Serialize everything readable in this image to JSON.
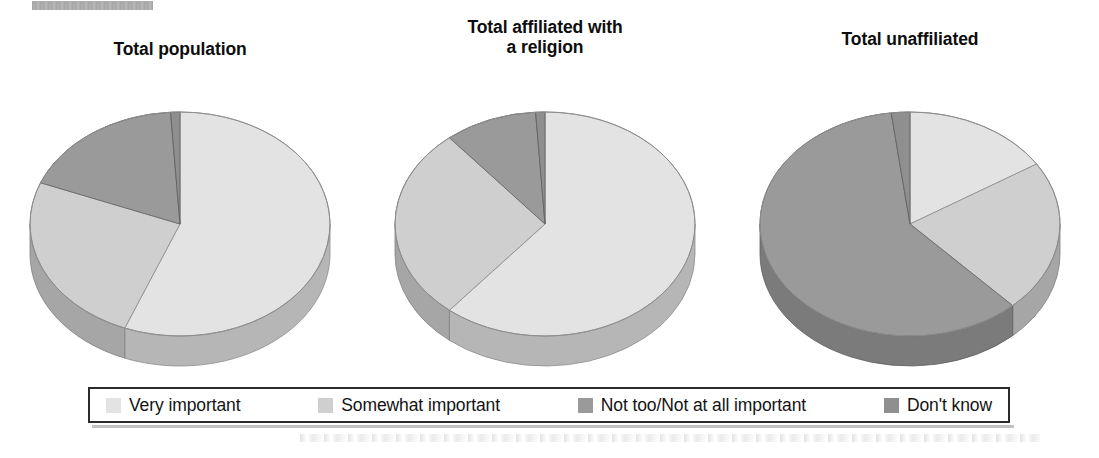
{
  "page": {
    "redacted_bar": "redacted-source-label",
    "background_color": "#ffffff"
  },
  "legend": {
    "items": [
      {
        "label": "Very important",
        "color": "#e3e3e3",
        "key": "very_important"
      },
      {
        "label": "Somewhat important",
        "color": "#cfcfcf",
        "key": "somewhat_important"
      },
      {
        "label": "Not too/Not at all important",
        "color": "#9a9a9a",
        "key": "not_too_not_at_all_important"
      },
      {
        "label": "Don't know",
        "color": "#8f8f8f",
        "key": "dont_know"
      }
    ]
  },
  "chart_data": {
    "type": "pie",
    "title": "",
    "subtitle": "",
    "legend_position": "bottom",
    "legend_entries": [
      "Very important",
      "Somewhat important",
      "Not too/Not at all important",
      "Don't know"
    ],
    "colors": [
      "#e3e3e3",
      "#cfcfcf",
      "#9a9a9a",
      "#8f8f8f"
    ],
    "units": "percent",
    "charts": [
      {
        "title": "Total population",
        "title_lines": [
          "Total population"
        ],
        "categories": [
          "Very important",
          "Somewhat important",
          "Not too/Not at all important",
          "Don't know"
        ],
        "values": [
          56,
          25,
          18,
          1
        ]
      },
      {
        "title": "Total affiliated with a religion",
        "title_lines": [
          "Total affiliated with",
          "a religion"
        ],
        "categories": [
          "Very important",
          "Somewhat important",
          "Not too/Not at all important",
          "Don't know"
        ],
        "values": [
          61,
          28,
          10,
          1
        ]
      },
      {
        "title": "Total unaffiliated",
        "title_lines": [
          "Total unaffiliated"
        ],
        "categories": [
          "Very important",
          "Somewhat important",
          "Not too/Not at all important",
          "Don't know"
        ],
        "values": [
          16,
          22,
          60,
          2
        ]
      }
    ]
  }
}
